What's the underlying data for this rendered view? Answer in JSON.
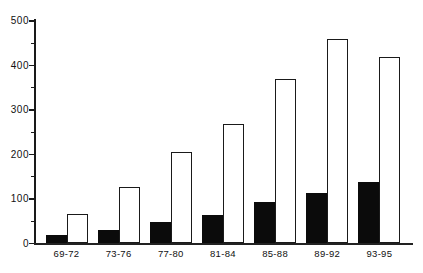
{
  "chart_data": {
    "type": "bar",
    "title": "",
    "subtitle": "",
    "xlabel": "",
    "ylabel": "",
    "categories": [
      "69-72",
      "73-76",
      "77-80",
      "81-84",
      "85-88",
      "89-92",
      "93-95"
    ],
    "series": [
      {
        "name": "filled-black-bars",
        "fill": "#0b0b0b",
        "border": "#0b0b0b",
        "values": [
          18,
          31,
          49,
          64,
          93,
          114,
          138
        ]
      },
      {
        "name": "open-white-bars",
        "fill": "#ffffff",
        "border": "#1a1a1a",
        "values": [
          66,
          127,
          206,
          268,
          370,
          459,
          419
        ]
      }
    ],
    "ylim": [
      0,
      500
    ],
    "ytick_values": [
      0,
      100,
      200,
      300,
      400,
      500
    ],
    "ytick_labels": [
      "0",
      "100",
      "200",
      "300",
      "400",
      "500"
    ],
    "yminor_values": [
      50,
      150,
      250,
      350,
      450
    ],
    "grid": false,
    "legend": "none",
    "colors": {
      "axis": "#1a1a1a",
      "baseline": "#222222",
      "text": "#111111",
      "background": "#ffffff"
    }
  }
}
